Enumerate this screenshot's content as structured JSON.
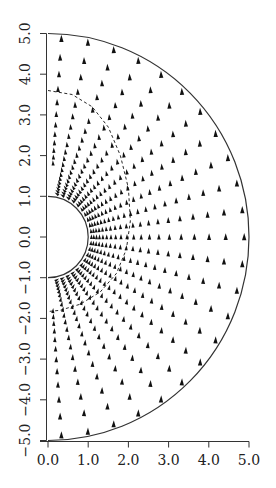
{
  "chart_data": {
    "type": "vector_field",
    "title": "",
    "xlabel": "",
    "ylabel": "",
    "xlim": [
      0.0,
      5.0
    ],
    "ylim": [
      -5.0,
      5.0
    ],
    "x_ticks": [
      "0.0",
      "1.0",
      "2.0",
      "3.0",
      "4.0",
      "5.0"
    ],
    "y_ticks": [
      "-5.0",
      "-4.0",
      "-3.0",
      "-2.0",
      "-1.0",
      "0.0",
      "1.0",
      "2.0",
      "3.0",
      "4.0",
      "5.0"
    ],
    "grid": false,
    "legend": null,
    "domain": {
      "shape": "half-annulus",
      "inner_radius": 1.0,
      "outer_radius": 5.0,
      "angle_range_deg": [
        -90,
        90
      ]
    },
    "field": {
      "description": "uniform flow in +y direction past a circular cylinder (potential flow)",
      "free_stream_direction": "+y",
      "cylinder_radius": 1.0
    },
    "sample_grid": {
      "rays": 23,
      "rings": 20,
      "ring_grading": 1.12
    },
    "dashed_curve": {
      "description": "dashed contour enclosing the near-cylinder region",
      "points": [
        [
          0.0,
          3.6
        ],
        [
          0.6,
          3.5
        ],
        [
          1.1,
          3.2
        ],
        [
          1.5,
          2.7
        ],
        [
          1.8,
          2.0
        ],
        [
          2.0,
          1.2
        ],
        [
          2.05,
          0.4
        ],
        [
          1.95,
          -0.3
        ],
        [
          1.7,
          -0.9
        ],
        [
          1.3,
          -1.35
        ],
        [
          0.8,
          -1.65
        ],
        [
          0.3,
          -1.8
        ],
        [
          0.0,
          -1.83
        ]
      ]
    },
    "colors": {
      "foreground": "#111111",
      "boundary": "#333333",
      "background": "#ffffff"
    }
  }
}
